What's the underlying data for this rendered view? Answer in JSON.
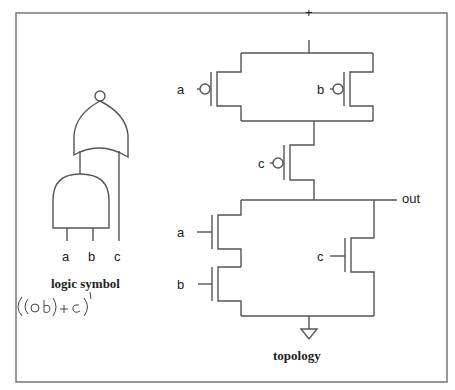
{
  "logic_symbol": {
    "caption": "logic symbol",
    "inputs": [
      "a",
      "b",
      "c"
    ],
    "gates": [
      {
        "type": "AND",
        "inputs": [
          "a",
          "b"
        ]
      },
      {
        "type": "NOR",
        "inputs": [
          "AND-out",
          "c"
        ]
      }
    ]
  },
  "annotation": {
    "handwritten_expression": "((a b) + c)'"
  },
  "topology": {
    "caption": "topology",
    "supply_label": "+",
    "output_label": "out",
    "pull_up": [
      {
        "type": "pmos",
        "gate": "a",
        "arrangement": "parallel"
      },
      {
        "type": "pmos",
        "gate": "b",
        "arrangement": "parallel"
      },
      {
        "type": "pmos",
        "gate": "c",
        "arrangement": "series"
      }
    ],
    "pull_down": [
      {
        "type": "nmos",
        "gate": "a",
        "arrangement": "series"
      },
      {
        "type": "nmos",
        "gate": "b",
        "arrangement": "series"
      },
      {
        "type": "nmos",
        "gate": "c",
        "arrangement": "parallel"
      }
    ],
    "ground": "ground-symbol"
  },
  "colors": {
    "line": "#555555",
    "frame": "#777777",
    "text": "#222222"
  }
}
